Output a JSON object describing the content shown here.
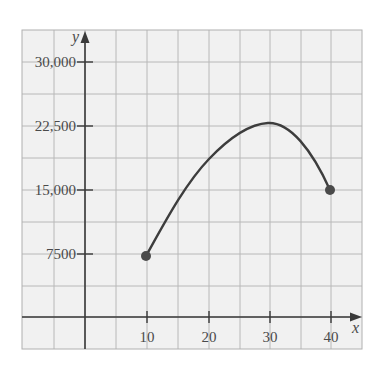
{
  "chart_data": {
    "type": "line",
    "title": "",
    "xlabel": "x",
    "ylabel": "y",
    "xlim": [
      -10,
      45
    ],
    "ylim": [
      -5000,
      33750
    ],
    "x_ticks": [
      10,
      20,
      30,
      40
    ],
    "x_tick_labels": [
      "10",
      "20",
      "30",
      "40"
    ],
    "y_ticks": [
      7500,
      15000,
      22500,
      30000
    ],
    "y_tick_labels": [
      "7500",
      "15,000",
      "22,500",
      "30,000"
    ],
    "grid": true,
    "grid_x_step": 5,
    "grid_y_step": 3750,
    "legend": null,
    "series": [
      {
        "name": "curve",
        "x": [
          10,
          15,
          20,
          25,
          29.5,
          35,
          40
        ],
        "y": [
          7200,
          13200,
          18500,
          21400,
          22700,
          20500,
          14900
        ],
        "endpoints": "closed-dots"
      }
    ],
    "colors": {
      "curve": "#3d3d3d",
      "axis": "#3a3a3a",
      "grid": "#b8b8b8",
      "background": "#f1f1f1"
    }
  },
  "labels": {
    "x_axis": "x",
    "y_axis": "y",
    "x_ticks": [
      "10",
      "20",
      "30",
      "40"
    ],
    "y_ticks": [
      "30,000",
      "22,500",
      "15,000",
      "7500"
    ]
  }
}
